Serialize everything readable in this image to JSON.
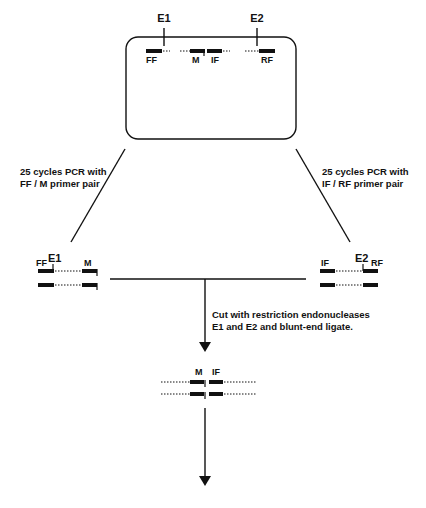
{
  "genome": {
    "sites": [
      "E1",
      "E2"
    ],
    "primers": [
      "FF",
      "M",
      "IF",
      "RF"
    ]
  },
  "left_branch": {
    "caption_line1": "25 cycles PCR with",
    "caption_line2": "FF / M primer pair",
    "site": "E1",
    "primer_left": "FF",
    "primer_right": "M"
  },
  "right_branch": {
    "caption_line1": "25 cycles PCR with",
    "caption_line2": "IF / RF primer pair",
    "site": "E2",
    "primer_left": "IF",
    "primer_right": "RF"
  },
  "ligation_step": {
    "caption_line1": "Cut with restriction endonucleases",
    "caption_line2": "E1 and E2 and blunt-end ligate.",
    "label_left": "M",
    "label_right": "IF"
  }
}
